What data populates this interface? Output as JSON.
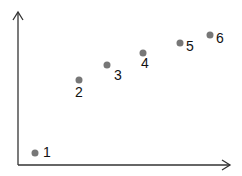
{
  "chart_data": {
    "type": "scatter",
    "title": "",
    "xlabel": "",
    "ylabel": "",
    "grid": false,
    "legend": null,
    "axis_ticks": false,
    "xlim": [
      0,
      10
    ],
    "ylim": [
      0,
      10
    ],
    "points": [
      {
        "label": "1",
        "x": 0.8,
        "y": 0.8
      },
      {
        "label": "2",
        "x": 2.9,
        "y": 5.5
      },
      {
        "label": "3",
        "x": 4.2,
        "y": 6.5
      },
      {
        "label": "4",
        "x": 5.9,
        "y": 7.3
      },
      {
        "label": "5",
        "x": 7.6,
        "y": 8.0
      },
      {
        "label": "6",
        "x": 9.0,
        "y": 8.5
      }
    ]
  },
  "style": {
    "point_color": "#777777",
    "axis_color": "#333333",
    "label_color": "#111111"
  },
  "layout": {
    "origin_px": [
      18,
      165
    ],
    "x_axis_end_px": 230,
    "y_axis_end_px": 12,
    "points_px": [
      {
        "label": "1",
        "cx": 35,
        "cy": 153,
        "lx": 43,
        "ly": 157
      },
      {
        "label": "2",
        "cx": 79,
        "cy": 80,
        "lx": 75,
        "ly": 97
      },
      {
        "label": "3",
        "cx": 107,
        "cy": 65,
        "lx": 114,
        "ly": 80
      },
      {
        "label": "4",
        "cx": 143,
        "cy": 53,
        "lx": 141,
        "ly": 68
      },
      {
        "label": "5",
        "cx": 180,
        "cy": 43,
        "lx": 186,
        "ly": 51
      },
      {
        "label": "6",
        "cx": 210,
        "cy": 35,
        "lx": 216,
        "ly": 43
      }
    ]
  }
}
